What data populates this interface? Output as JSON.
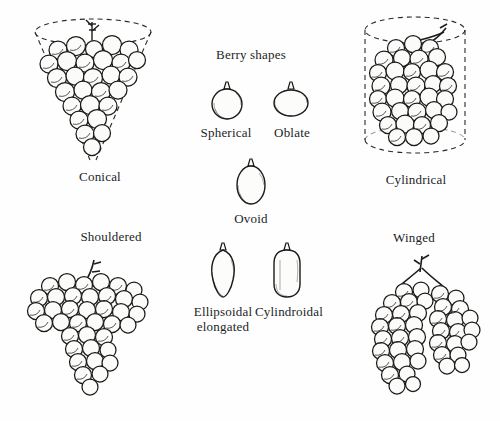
{
  "figure": {
    "title": "Berry shapes",
    "background_color": "#fefefe",
    "ink_color": "#1f1d1c",
    "cluster_shapes": [
      {
        "id": "conical",
        "label": "Conical",
        "guide": "dashed-cone",
        "position": "top-left"
      },
      {
        "id": "cylindrical",
        "label": "Cylindrical",
        "guide": "dashed-cylinder",
        "position": "top-right"
      },
      {
        "id": "shouldered",
        "label": "Shouldered",
        "guide": "none",
        "position": "bottom-left"
      },
      {
        "id": "winged",
        "label": "Winged",
        "guide": "none",
        "position": "bottom-right"
      }
    ],
    "berry_shapes": [
      {
        "id": "spherical",
        "label": "Spherical"
      },
      {
        "id": "oblate",
        "label": "Oblate"
      },
      {
        "id": "ovoid",
        "label": "Ovoid"
      },
      {
        "id": "ellipsoidal-elongated",
        "label": "Ellipsoidal\nelongated"
      },
      {
        "id": "cylindroidal",
        "label": "Cylindroidal"
      }
    ]
  }
}
